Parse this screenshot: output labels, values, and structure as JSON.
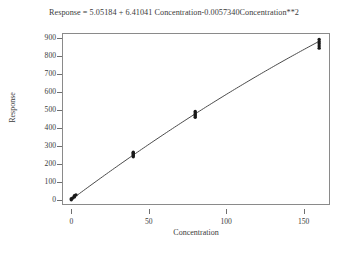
{
  "chart_data": {
    "type": "scatter",
    "title": "Response = 5.05184 + 6.41041 Concentration-0.0057340Concentration**2",
    "xlabel": "Concentration",
    "ylabel": "Response",
    "xlim": [
      -6,
      167
    ],
    "ylim": [
      -25,
      930
    ],
    "xticks": [
      0,
      50,
      100,
      150
    ],
    "xtick_labels": [
      "0",
      "50",
      "100",
      "150"
    ],
    "yticks": [
      0,
      100,
      200,
      300,
      400,
      500,
      600,
      700,
      800,
      900
    ],
    "ytick_labels": [
      "0",
      "100",
      "200",
      "300",
      "400",
      "500",
      "600",
      "700",
      "800",
      "900"
    ],
    "grid": false,
    "legend": false,
    "series": [
      {
        "name": "Observed",
        "marker": "filled-circle",
        "color": "#1a1a1a",
        "points": [
          {
            "x": 0,
            "y": 4
          },
          {
            "x": 0,
            "y": 10
          },
          {
            "x": 1,
            "y": 14
          },
          {
            "x": 2,
            "y": 20
          },
          {
            "x": 2,
            "y": 26
          },
          {
            "x": 3,
            "y": 31
          },
          {
            "x": 40,
            "y": 243
          },
          {
            "x": 40,
            "y": 250
          },
          {
            "x": 40,
            "y": 256
          },
          {
            "x": 40,
            "y": 262
          },
          {
            "x": 40,
            "y": 268
          },
          {
            "x": 80,
            "y": 462
          },
          {
            "x": 80,
            "y": 470
          },
          {
            "x": 80,
            "y": 478
          },
          {
            "x": 80,
            "y": 486
          },
          {
            "x": 80,
            "y": 494
          },
          {
            "x": 160,
            "y": 846
          },
          {
            "x": 160,
            "y": 858
          },
          {
            "x": 160,
            "y": 870
          },
          {
            "x": 160,
            "y": 882
          },
          {
            "x": 160,
            "y": 894
          }
        ]
      }
    ],
    "fit": {
      "name": "Quadratic fit",
      "equation": "Response = 5.05184 + 6.41041*Concentration - 0.0057340*Concentration^2",
      "intercept": 5.05184,
      "linear_coefficient": 6.41041,
      "quadratic_coefficient": -0.005734,
      "color": "#4a4a4a",
      "x_start": 0,
      "x_end": 160
    }
  }
}
